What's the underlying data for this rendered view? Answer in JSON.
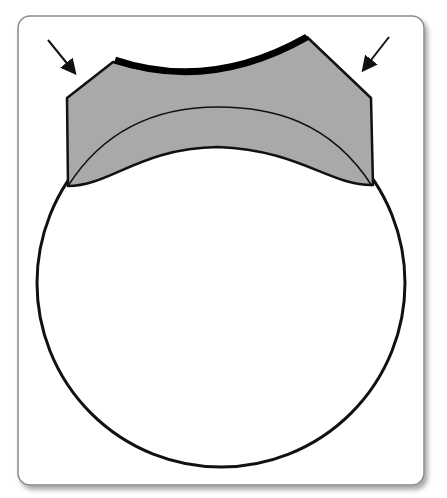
{
  "figure": {
    "type": "schematic diagram",
    "colors": {
      "background": "#ffffff",
      "frame_border": "#8a8a8a",
      "frame_shadow": "#d0d0d0",
      "cap_fill": "#a9a9a9",
      "outline": "#111111",
      "top_arc": "#000000"
    },
    "elements": {
      "frame": {
        "shape": "rounded-rectangle"
      },
      "circle": {
        "shape": "circle"
      },
      "cap_region": {
        "shape": "shaded polygon with curved edges"
      },
      "inner_arc": {
        "shape": "arc"
      },
      "top_edge": {
        "shape": "heavy concave arc"
      },
      "left_arrow": {
        "direction": "down-right"
      },
      "right_arrow": {
        "direction": "down-left"
      }
    }
  }
}
